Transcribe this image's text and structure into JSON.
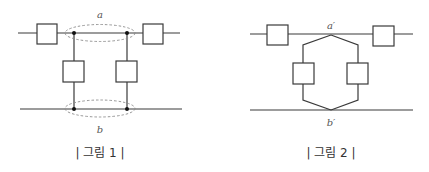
{
  "figures": [
    {
      "id": "figure-1",
      "caption": "| 그림 1 |",
      "label_top": "a",
      "label_bottom": "b",
      "description": "Two series boxes on top wire; between them two junction nodes grouped by dashed ellipse a; two parallel boxes connect down to two nodes on bottom wire grouped by dashed ellipse b"
    },
    {
      "id": "figure-2",
      "caption": "| 그림 2 |",
      "label_top": "a′",
      "label_bottom": "b′",
      "description": "Two series boxes on top wire; single junction a′ splits into hexagonal parallel branch with two boxes that rejoin at single junction b′ on bottom wire"
    }
  ],
  "colors": {
    "line": "#3a3a3a",
    "dashed_ellipse": "#8a8a8a",
    "node": "#111111",
    "background": "#ffffff"
  }
}
